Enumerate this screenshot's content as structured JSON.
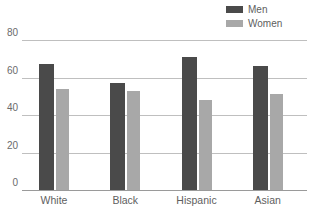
{
  "chart_data": {
    "type": "bar",
    "title": "",
    "subtitle": "",
    "xlabel": "",
    "ylabel": "",
    "categories": [
      "White",
      "Black",
      "Hispanic",
      "Asian"
    ],
    "series": [
      {
        "name": "Men",
        "values": [
          67,
          57,
          71,
          66
        ],
        "color": "#4a4a4a"
      },
      {
        "name": "Women",
        "values": [
          54,
          53,
          48,
          51
        ],
        "color": "#a8a8a8"
      }
    ],
    "ylim": [
      0,
      80
    ],
    "yticks": [
      0,
      20,
      40,
      60,
      80
    ],
    "ytick_labels": [
      "0",
      "20",
      "40",
      "60",
      "80"
    ],
    "grid": true,
    "grid_axis": "y",
    "legend_position": "top-right",
    "annotations": []
  },
  "legend": {
    "entries": [
      {
        "label": "Men",
        "swatch_name": "legend-swatch-men",
        "color": "#4a4a4a"
      },
      {
        "label": "Women",
        "swatch_name": "legend-swatch-women",
        "color": "#a8a8a8"
      }
    ]
  },
  "axes": {
    "y_tick_labels": [
      "80",
      "60",
      "40",
      "20",
      "0"
    ],
    "x_tick_labels": [
      "White",
      "Black",
      "Hispanic",
      "Asian"
    ]
  },
  "colors": {
    "men": "#4a4a4a",
    "women": "#a8a8a8",
    "gridline": "#bfbfbf",
    "baseline": "#9a9a9a",
    "text": "#5e5e5e",
    "background": "#ffffff"
  }
}
